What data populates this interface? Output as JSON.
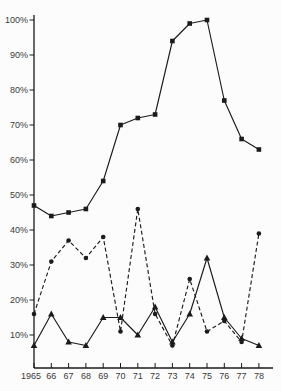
{
  "meta": {
    "background_color": "#fcfcfc",
    "ink_color": "#1b1b1b",
    "label_color": "#3a3a3a"
  },
  "chart_data": {
    "type": "line",
    "title": "",
    "xlabel": "",
    "ylabel": "",
    "grid": false,
    "legend": "none",
    "ylim": [
      0,
      100
    ],
    "y_ticks": [
      10,
      20,
      30,
      40,
      50,
      60,
      70,
      80,
      90,
      100
    ],
    "y_tick_labels": [
      "10%",
      "20%",
      "30%",
      "40%",
      "50%",
      "60%",
      "70%",
      "80%",
      "90%",
      "100%"
    ],
    "categories": [
      "1965",
      "66",
      "67",
      "68",
      "69",
      "70",
      "71",
      "72",
      "73",
      "74",
      "75",
      "76",
      "77",
      "78"
    ],
    "series": [
      {
        "name": "circles",
        "marker": "circle",
        "line_style": "dashed",
        "values": [
          16,
          31,
          37,
          32,
          38,
          11,
          46,
          16,
          7,
          26,
          11,
          14,
          8,
          39
        ]
      },
      {
        "name": "triangles",
        "marker": "triangle",
        "line_style": "solid",
        "values": [
          7,
          16,
          8,
          7,
          15,
          15,
          10,
          18,
          8,
          16,
          32,
          15,
          9,
          7
        ]
      },
      {
        "name": "squares",
        "marker": "square",
        "line_style": "solid",
        "values": [
          47,
          44,
          45,
          46,
          54,
          70,
          72,
          73,
          94,
          99,
          100,
          77,
          66,
          63
        ]
      }
    ]
  }
}
